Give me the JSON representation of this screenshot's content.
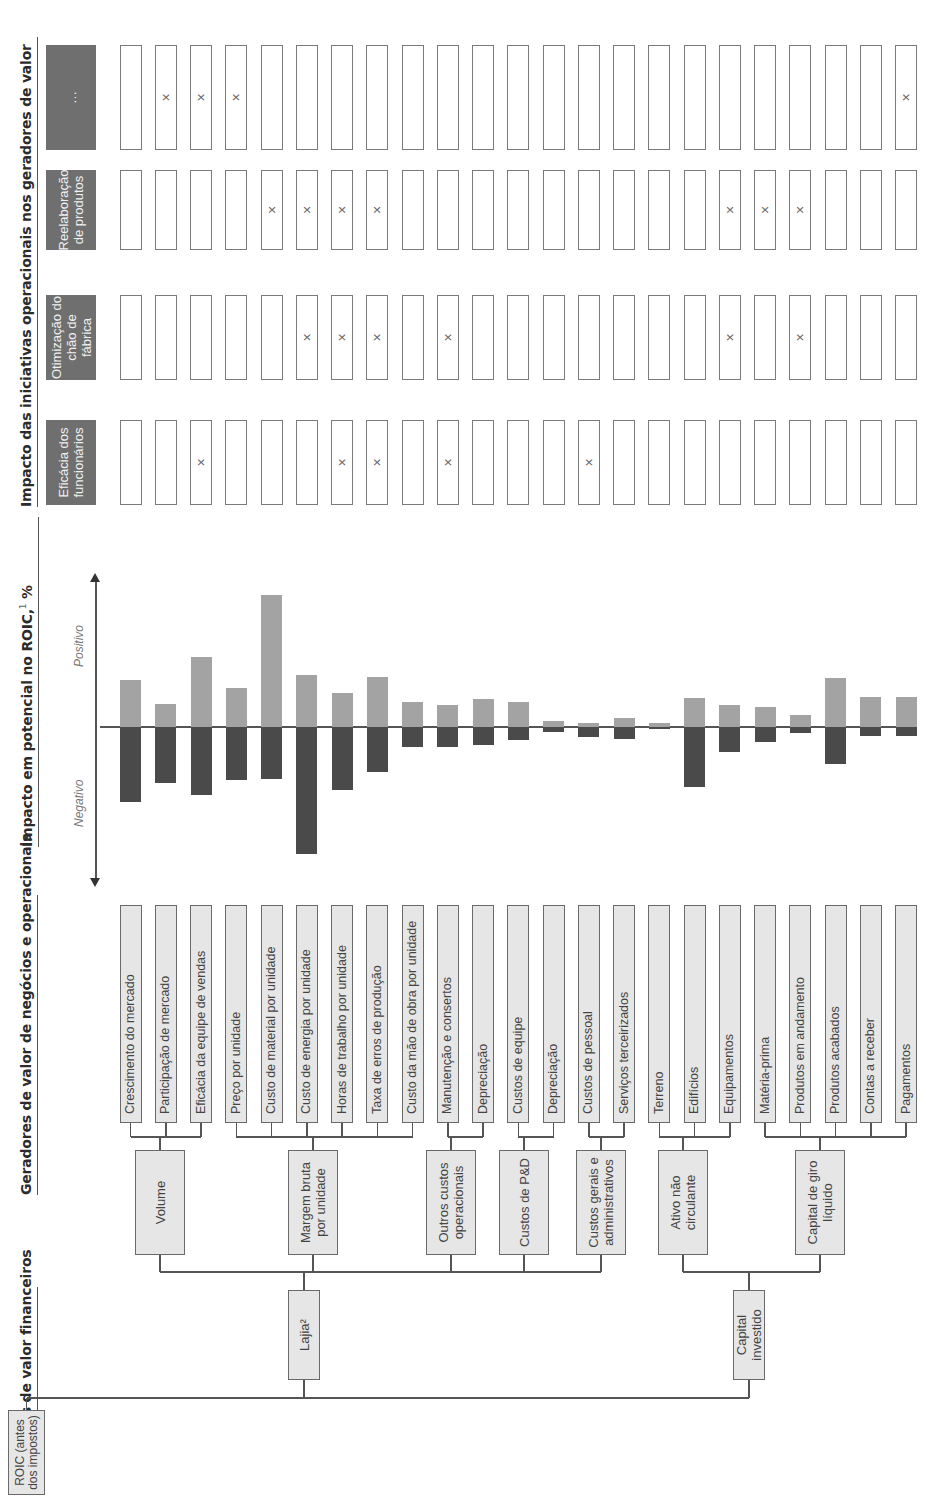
{
  "headers": {
    "financial": "Geradores de valor financeiros",
    "business": "Geradores de valor de negócios e operacionais",
    "impact": "Impacto em potencial no ROIC,",
    "impact_sup": "1",
    "impact_unit": " %",
    "initiatives": "Impacto das iniciativas operacionais nos geradores de valor"
  },
  "financial_tree": {
    "root": "ROIC (antes dos impostos)",
    "level1": [
      {
        "label": "Lajia²"
      },
      {
        "label": "Capital investido"
      }
    ],
    "level2": [
      {
        "label": "Volume",
        "parent": 0
      },
      {
        "label": "Margem bruta por unidade",
        "parent": 0
      },
      {
        "label": "Outros custos operacionais",
        "parent": 0
      },
      {
        "label": "Custos de P&D",
        "parent": 0
      },
      {
        "label": "Custos gerais e administrativos",
        "parent": 0
      },
      {
        "label": "Ativo não circulante",
        "parent": 1
      },
      {
        "label": "Capital de giro líquido",
        "parent": 1
      }
    ]
  },
  "drivers": [
    {
      "label": "Crescimento do mercado",
      "group": "Volume"
    },
    {
      "label": "Participação de mercado",
      "group": "Volume"
    },
    {
      "label": "Eficácia da equipe de vendas",
      "group": "Volume"
    },
    {
      "label": "Preço por unidade",
      "group": "Margem bruta por unidade"
    },
    {
      "label": "Custo de material por unidade",
      "group": "Margem bruta por unidade"
    },
    {
      "label": "Custo de energia por unidade",
      "group": "Margem bruta por unidade"
    },
    {
      "label": "Horas de trabalho por unidade",
      "group": "Margem bruta por unidade"
    },
    {
      "label": "Taxa de erros de produção",
      "group": "Margem bruta por unidade"
    },
    {
      "label": "Custo da mão de obra por unidade",
      "group": "Margem bruta por unidade"
    },
    {
      "label": "Manutenção e consertos",
      "group": "Outros custos operacionais"
    },
    {
      "label": "Depreciação",
      "group": "Outros custos operacionais"
    },
    {
      "label": "Custos de equipe",
      "group": "Custos de P&D"
    },
    {
      "label": "Depreciação",
      "group": "Custos de P&D"
    },
    {
      "label": "Custos de pessoal",
      "group": "Custos gerais e administrativos"
    },
    {
      "label": "Serviços terceirizados",
      "group": "Custos gerais e administrativos"
    },
    {
      "label": "Terreno",
      "group": "Ativo não circulante"
    },
    {
      "label": "Edifícios",
      "group": "Ativo não circulante"
    },
    {
      "label": "Equipamentos",
      "group": "Ativo não circulante"
    },
    {
      "label": "Matéria-prima",
      "group": "Capital de giro líquido"
    },
    {
      "label": "Produtos em andamento",
      "group": "Capital de giro líquido"
    },
    {
      "label": "Produtos acabados",
      "group": "Capital de giro líquido"
    },
    {
      "label": "Contas a receber",
      "group": "Capital de giro líquido"
    },
    {
      "label": "Pagamentos",
      "group": "Capital de giro líquido"
    }
  ],
  "chart_data": {
    "type": "bar",
    "xlabel": "",
    "ylabel": "",
    "axis_labels": {
      "positive": "Positivo",
      "negative": "Negativo"
    },
    "categories": [
      "Crescimento do mercado",
      "Participação de mercado",
      "Eficácia da equipe de vendas",
      "Preço por unidade",
      "Custo de material por unidade",
      "Custo de energia por unidade",
      "Horas de trabalho por unidade",
      "Taxa de erros de produção",
      "Custo da mão de obra por unidade",
      "Manutenção e consertos",
      "Depreciação",
      "Custos de equipe",
      "Depreciação",
      "Custos de pessoal",
      "Serviços terceirizados",
      "Terreno",
      "Edifícios",
      "Equipamentos",
      "Matéria-prima",
      "Produtos em andamento",
      "Produtos acabados",
      "Contas a receber",
      "Pagamentos"
    ],
    "series": [
      {
        "name": "Positivo",
        "values": [
          47,
          23,
          70,
          39,
          132,
          52,
          34,
          50,
          25,
          22,
          28,
          25,
          6,
          4,
          9,
          4,
          29,
          22,
          20,
          12,
          49,
          30,
          30
        ]
      },
      {
        "name": "Negativo",
        "values": [
          -75,
          -56,
          -68,
          -53,
          -52,
          -127,
          -63,
          -45,
          -20,
          -20,
          -18,
          -13,
          -5,
          -10,
          -12,
          -2,
          -60,
          -25,
          -15,
          -6,
          -37,
          -9,
          -9
        ]
      }
    ],
    "units": "relative (no numeric scale shown)",
    "grid": false
  },
  "initiatives": {
    "columns": [
      {
        "label": "Eficácia dos funcionários",
        "marks": [
          2,
          6,
          7,
          9,
          13
        ]
      },
      {
        "label": "Otimização do chão de fábrica",
        "marks": [
          5,
          6,
          7,
          9,
          17,
          19
        ]
      },
      {
        "label": "Reelaboração de produtos",
        "marks": [
          4,
          5,
          6,
          7,
          17,
          18,
          19
        ]
      },
      {
        "label": "…",
        "marks": [
          1,
          2,
          3,
          22
        ]
      }
    ],
    "mark_symbol": "×"
  },
  "colors": {
    "positive_bar": "#a3a3a3",
    "negative_bar": "#4a4a4a",
    "box_fill": "#e6e6e6",
    "initiative_header": "#6f6f6f"
  }
}
